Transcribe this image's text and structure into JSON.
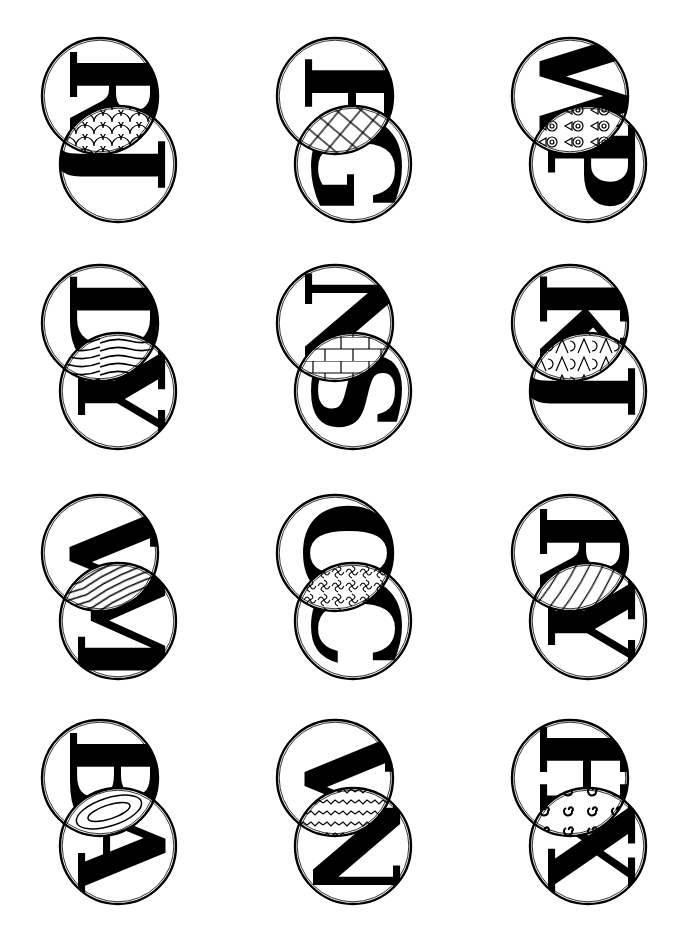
{
  "page": {
    "rows": 4,
    "cols": 3
  },
  "monograms": [
    {
      "top_letter": "R",
      "bottom_letter": "J",
      "pattern": "scales",
      "x": 40,
      "y": 38
    },
    {
      "top_letter": "F",
      "bottom_letter": "G",
      "pattern": "diamond-grid",
      "x": 275,
      "y": 38
    },
    {
      "top_letter": "W",
      "bottom_letter": "P",
      "pattern": "eyes",
      "x": 510,
      "y": 38
    },
    {
      "top_letter": "D",
      "bottom_letter": "Y",
      "pattern": "wave-lines",
      "x": 40,
      "y": 265
    },
    {
      "top_letter": "N",
      "bottom_letter": "S",
      "pattern": "brick",
      "x": 275,
      "y": 265
    },
    {
      "top_letter": "K",
      "bottom_letter": "J",
      "pattern": "letterforms",
      "x": 510,
      "y": 265
    },
    {
      "top_letter": "V",
      "bottom_letter": "M",
      "pattern": "diagonal-arcs",
      "x": 40,
      "y": 495
    },
    {
      "top_letter": "O",
      "bottom_letter": "C",
      "pattern": "squiggles",
      "x": 275,
      "y": 495
    },
    {
      "top_letter": "R",
      "bottom_letter": "Y",
      "pattern": "yarn-ball",
      "x": 510,
      "y": 495
    },
    {
      "top_letter": "B",
      "bottom_letter": "A",
      "pattern": "nested-lens",
      "x": 40,
      "y": 720
    },
    {
      "top_letter": "V",
      "bottom_letter": "N",
      "pattern": "zigzag",
      "x": 275,
      "y": 720
    },
    {
      "top_letter": "H",
      "bottom_letter": "X",
      "pattern": "swirls",
      "x": 510,
      "y": 720
    }
  ]
}
